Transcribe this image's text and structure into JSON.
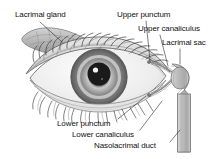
{
  "figure": {
    "background_color": "#ffffff",
    "ink_color": "#111111",
    "width": 222,
    "height": 159
  },
  "labels": {
    "lacrimal_gland": "Lacrimal gland",
    "upper_punctum": "Upper punctum",
    "upper_canaliculus": "Upper canaliculus",
    "lacrimal_sac": "Lacrimal sac",
    "lower_punctum": "Lower punctum",
    "lower_canaliculus": "Lower canaliculus",
    "nasolacrimal_duct": "Nasolacrimal duct"
  },
  "anatomy": {
    "iris_color": "#8a8a8a",
    "pupil_color": "#1a1a1a",
    "sclera_color": "#f2f2f2",
    "gland_color": "#b8b8b8",
    "duct_color": "#bdbdbd",
    "highlight_color": "#ffffff"
  }
}
